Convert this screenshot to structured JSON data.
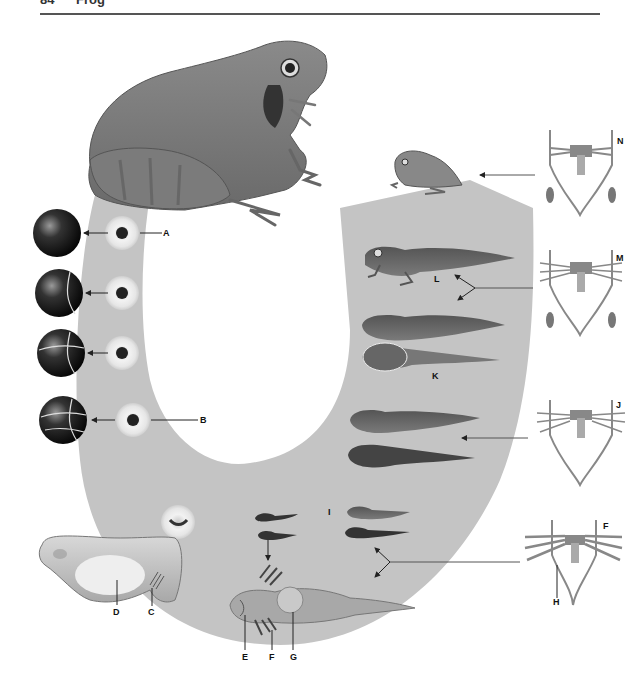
{
  "header": {
    "page_number": "84",
    "title": "Frog"
  },
  "colors": {
    "cycle_band": "#c4c4c4",
    "ink": "#222222",
    "background": "#ffffff"
  },
  "diagram": {
    "stages": [
      {
        "id": "adult",
        "description": "Adult frog"
      },
      {
        "id": "A",
        "label": "A",
        "description": "Fertilized egg (single cell)"
      },
      {
        "id": "cleavage-2",
        "description": "Two-cell stage"
      },
      {
        "id": "cleavage-4",
        "description": "Four-cell stage"
      },
      {
        "id": "B",
        "label": "B",
        "description": "Eight-cell stage"
      },
      {
        "id": "embryo",
        "description": "Embryo in jelly"
      },
      {
        "id": "C",
        "label": "C",
        "description": "External gill buds"
      },
      {
        "id": "D",
        "label": "D",
        "description": "Yolk sac"
      },
      {
        "id": "E",
        "label": "E",
        "description": "Gill slits / mouth region"
      },
      {
        "id": "F",
        "label": "F",
        "description": "External gills"
      },
      {
        "id": "G",
        "label": "G",
        "description": "Adhesive organ / sucker"
      },
      {
        "id": "H",
        "label": "H",
        "description": "Aortic arches (circulation diagram)"
      },
      {
        "id": "I",
        "label": "I",
        "description": "Young tadpoles"
      },
      {
        "id": "J",
        "label": "J",
        "description": "Circulation diagram, gills internal"
      },
      {
        "id": "K",
        "label": "K",
        "description": "Tadpole with hind limbs"
      },
      {
        "id": "L",
        "label": "L",
        "description": "Tadpole with four limbs"
      },
      {
        "id": "M",
        "label": "M",
        "description": "Circulation diagram with lungs"
      },
      {
        "id": "N",
        "label": "N",
        "description": "Circulation diagram of froglet"
      },
      {
        "id": "froglet",
        "description": "Young froglet"
      }
    ],
    "labels": {
      "A": "A",
      "B": "B",
      "C": "C",
      "D": "D",
      "E": "E",
      "F": "F",
      "G": "G",
      "H": "H",
      "I": "I",
      "J": "J",
      "K": "K",
      "L": "L",
      "M": "M",
      "N": "N",
      "F2": "F"
    }
  }
}
